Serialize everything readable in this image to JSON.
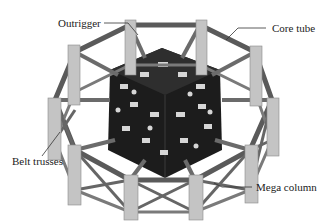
{
  "figure": {
    "labels": {
      "outrigger": "Outrigger",
      "core_tube": "Core tube",
      "belt_trusses": "Belt trusses",
      "mega_column": "Mega column"
    },
    "colors": {
      "frame": "#5a5a5a",
      "column": "#bdbdbd",
      "core": "#1a1a1a",
      "opening": "#d9d9d9",
      "leader_line": "#333333"
    }
  }
}
